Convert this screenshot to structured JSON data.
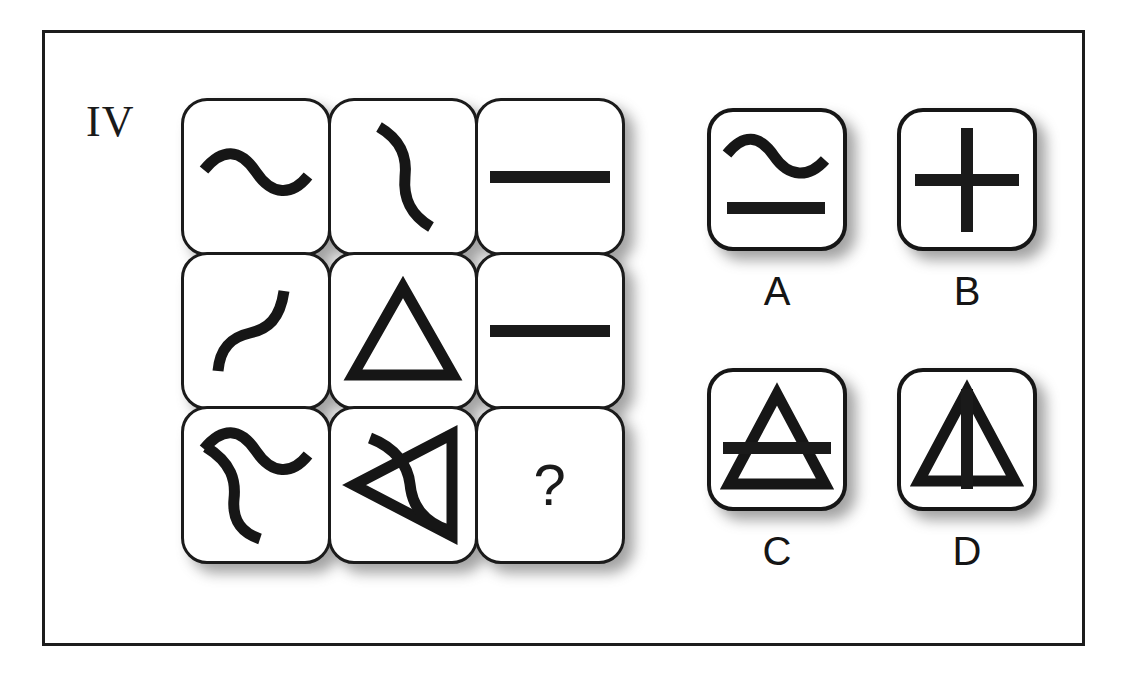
{
  "item": {
    "number_label": "IV",
    "type": "matrix-reasoning-analogy",
    "missing_cell_marker": "?"
  },
  "colors": {
    "ink": "#161616",
    "frame": "#1c1c1c",
    "cell_background": "#ffffff",
    "page_background": "#ffffff",
    "shadow": "#3c3c3c",
    "grid_gap_diamond": "#3d3d3d"
  },
  "matrix": {
    "rows": 3,
    "columns": 3,
    "cells": [
      {
        "position": "r1c1",
        "shape": "horizontal-tilde-wave",
        "description": "S-shaped wave drawn horizontally"
      },
      {
        "position": "r1c2",
        "shape": "vertical-s-curve",
        "description": "S-shaped wave rotated 90 degrees, drawn vertically"
      },
      {
        "position": "r1c3",
        "shape": "horizontal-bar",
        "description": "thick horizontal line segment"
      },
      {
        "position": "r2c1",
        "shape": "diagonal-s-curve",
        "description": "S-shaped wave rotated about 45 degrees"
      },
      {
        "position": "r2c2",
        "shape": "triangle-up",
        "description": "outline equilateral triangle pointing up"
      },
      {
        "position": "r2c3",
        "shape": "horizontal-bar",
        "description": "thick horizontal line segment"
      },
      {
        "position": "r3c1",
        "shape": "tilde-plus-vertical-s-curve",
        "description": "horizontal tilde overlaid with vertical S-curve"
      },
      {
        "position": "r3c2",
        "shape": "triangle-left-with-curve",
        "description": "triangle pointing left overlaid with an S-curve"
      },
      {
        "position": "r3c3",
        "shape": "question-mark",
        "description": "missing element placeholder"
      }
    ]
  },
  "options": [
    {
      "id": "A",
      "label": "A",
      "shape": "tilde-over-bar",
      "description": "horizontal tilde above a thick horizontal bar"
    },
    {
      "id": "B",
      "label": "B",
      "shape": "plus-cross",
      "description": "thick plus / cross sign"
    },
    {
      "id": "C",
      "label": "C",
      "shape": "triangle-up-with-horizontal-bar",
      "description": "upward triangle crossed by a horizontal bar"
    },
    {
      "id": "D",
      "label": "D",
      "shape": "triangle-up-with-vertical-bar",
      "description": "upward triangle with a vertical bar through its centre"
    }
  ]
}
